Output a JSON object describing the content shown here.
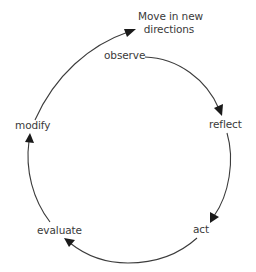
{
  "diagram": {
    "type": "cycle",
    "title_node": {
      "line1": "Move in new",
      "line2": "directions"
    },
    "nodes": [
      {
        "id": "observe",
        "label": "observe"
      },
      {
        "id": "reflect",
        "label": "reflect"
      },
      {
        "id": "act",
        "label": "act"
      },
      {
        "id": "evaluate",
        "label": "evaluate"
      },
      {
        "id": "modify",
        "label": "modify"
      }
    ],
    "edges": [
      {
        "from": "observe",
        "to": "reflect"
      },
      {
        "from": "reflect",
        "to": "act"
      },
      {
        "from": "act",
        "to": "evaluate"
      },
      {
        "from": "evaluate",
        "to": "modify"
      },
      {
        "from": "modify",
        "to": "Move in new directions"
      }
    ],
    "colors": {
      "text": "#3a3a3a",
      "line": "#3c3c3c",
      "arrowhead": "#1a1a1a",
      "background": "#ffffff"
    }
  }
}
